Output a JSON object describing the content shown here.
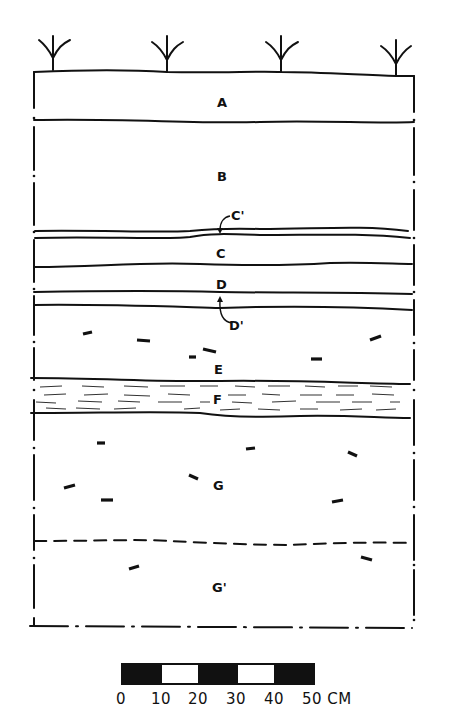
{
  "diagram": {
    "type": "soil-profile-cross-section",
    "surface_plants": 4,
    "layers": [
      {
        "id": "A",
        "label": "A"
      },
      {
        "id": "B",
        "label": "B"
      },
      {
        "id": "C1",
        "label": "C'"
      },
      {
        "id": "C",
        "label": "C"
      },
      {
        "id": "D",
        "label": "D"
      },
      {
        "id": "D1",
        "label": "D'"
      },
      {
        "id": "E",
        "label": "E"
      },
      {
        "id": "F",
        "label": "F"
      },
      {
        "id": "G",
        "label": "G"
      },
      {
        "id": "G1",
        "label": "G'"
      }
    ]
  },
  "scale_bar": {
    "ticks": [
      "0",
      "10",
      "20",
      "30",
      "40",
      "50 CM"
    ],
    "unit": "CM",
    "segments": [
      "black",
      "white",
      "black",
      "white",
      "black"
    ]
  },
  "colors": {
    "ink": "#111111",
    "background": "#ffffff"
  }
}
